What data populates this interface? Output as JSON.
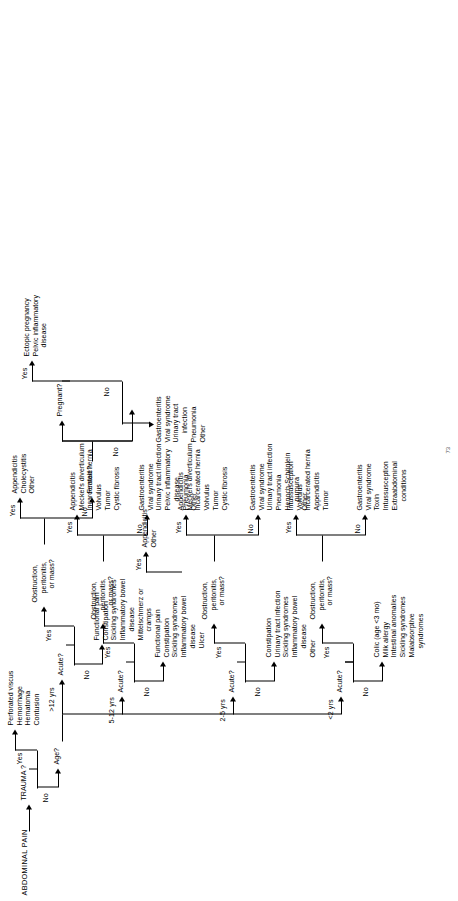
{
  "figure": {
    "root_label": "ABDOMINAL PAIN",
    "page_number": "73",
    "orientation": "rotated-90-ccw"
  },
  "decisions": {
    "trauma": "TRAUMA ?",
    "age": "Age?",
    "acute": "Acute?",
    "obstruction": "Obstruction,\nperitonitis,\nor mass?",
    "obstruction_l1": "Obstruction,",
    "obstruction_l2": "peritonitis,",
    "obstruction_l3": "or mass?",
    "female": "Female?",
    "pregnant": "Pregnant?"
  },
  "edges": {
    "yes": "Yes",
    "no": "No",
    "age_lt2": "<2 yrs",
    "age_2_5": "2-5 yrs",
    "age_5_12": "5-12 yrs",
    "age_gt12": ">12 yrs"
  },
  "outcomes": {
    "trauma_yes": [
      "Perforated viscus",
      "Hemorrhage",
      "Hematoma",
      "Contusion"
    ],
    "lt2_nonacute": [
      "Colic (age <3 mo)",
      "Milk allergy",
      "Intestinal anomalies",
      "Sickling syndromes",
      "Malabsorptive",
      "syndromes"
    ],
    "lt2_acute_obstruction_yes": [
      "Intussusception",
      "Volvulus",
      "Incarcerated hernia",
      "Appendicitis",
      "Tumor"
    ],
    "lt2_acute_obstruction_no": [
      "Gastroenteritis",
      "Viral syndrome",
      "Toxin",
      "Intussusception",
      "Extraabdominal",
      "conditions"
    ],
    "age2_5_nonacute": [
      "Constipation",
      "Urinary tract infection",
      "Sickling syndromes",
      "Inflammatory bowel",
      "disease",
      "Other"
    ],
    "age2_5_obstruction_yes": [
      "Appendicitis",
      "Meckel's diverticulum",
      "Incarcerated hernia",
      "Volvulus",
      "Tumor",
      "Cystic fibrosis"
    ],
    "age2_5_obstruction_no": [
      "Gastroenteritis",
      "Viral syndrome",
      "Urinary tract infection",
      "Pneumonia",
      "Henoch-Schönlein",
      "purpura",
      "Other"
    ],
    "age5_12_nonacute": [
      "Functional pain",
      "Constipation",
      "Sickling syndromes",
      "Inflammatory bowel",
      "disease",
      "Ulcer"
    ],
    "age5_12_obstruction_yes": [
      "Appendicitis",
      "Meckel's diverticulum",
      "Incarcerated hernia",
      "Volvulus",
      "Tumor",
      "Cystic fibrosis"
    ],
    "age5_12_obstruction_no": [
      "Gastroenteritis",
      "Viral syndrome",
      "Urinary tract infection",
      "Pelvic inflammatory",
      "disease",
      "Pneumonia",
      "Other"
    ],
    "gt12_nonacute": [
      "Functional pain",
      "Constipation",
      "Sickling syndromes",
      "Inflammatory bowel",
      "disease",
      "Mittelschmerz or",
      "cramps"
    ],
    "gt12_obstruction_yes": [
      "Appendicitis",
      "Cholecystitis",
      "Other"
    ],
    "gt12_appendicitis": [
      "Appendicitis",
      "Other"
    ],
    "pregnant_yes": [
      "Ectopic pregnancy",
      "Pelvic inflammatory",
      "disease"
    ],
    "gt12_common": [
      "Gastroenteritis",
      "Viral syndrome",
      "Urinary tract",
      "infection",
      "Pneumonia",
      "Other"
    ]
  }
}
